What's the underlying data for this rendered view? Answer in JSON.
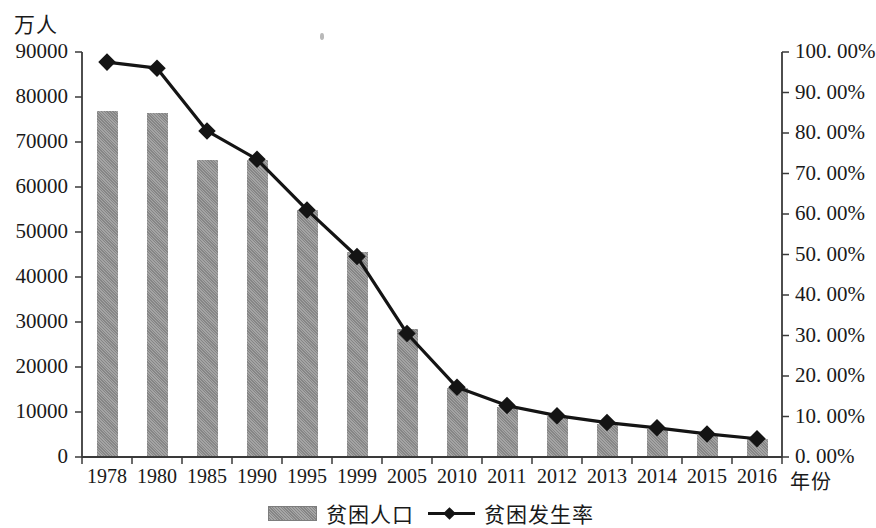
{
  "chart_data": {
    "type": "bar",
    "title": "",
    "subtitle": "",
    "xlabel": "年份",
    "ylabel": "万人",
    "ylabel_right": "",
    "categories": [
      "1978",
      "1980",
      "1985",
      "1990",
      "1995",
      "1999",
      "2005",
      "2010",
      "2011",
      "2012",
      "2013",
      "2014",
      "2015",
      "2016"
    ],
    "ylim": [
      0,
      90000
    ],
    "ylim_right": [
      0,
      100
    ],
    "ytick_labels": [
      "90000",
      "80000",
      "70000",
      "60000",
      "50000",
      "40000",
      "30000",
      "20000",
      "10000",
      "0"
    ],
    "ytick_values": [
      90000,
      80000,
      70000,
      60000,
      50000,
      40000,
      30000,
      20000,
      10000,
      0
    ],
    "ytick_labels_right": [
      "100. 00%",
      "90. 00%",
      "80. 00%",
      "70. 00%",
      "60. 00%",
      "50. 00%",
      "40. 00%",
      "30. 00%",
      "20. 00%",
      "10. 00%",
      "0. 00%"
    ],
    "ytick_values_right": [
      100,
      90,
      80,
      70,
      60,
      50,
      40,
      30,
      20,
      10,
      0
    ],
    "grid": false,
    "legend_position": "bottom",
    "series": [
      {
        "name": "贫困人口",
        "type": "bar",
        "axis": "left",
        "unit": "万人",
        "color": "#8d8d8d",
        "values": [
          77000,
          76500,
          66000,
          66000,
          55000,
          45500,
          28400,
          15300,
          11200,
          9200,
          7400,
          6300,
          4900,
          4100
        ]
      },
      {
        "name": "贫困发生率",
        "type": "line",
        "axis": "right",
        "unit": "%",
        "color": "#141414",
        "marker": "diamond",
        "values": [
          97.5,
          96.0,
          80.5,
          73.5,
          61.0,
          49.5,
          30.5,
          17.2,
          12.7,
          10.2,
          8.5,
          7.2,
          5.7,
          4.5
        ]
      }
    ]
  },
  "legend": {
    "items": [
      {
        "label": "贫困人口",
        "swatch": "bar-swatch"
      },
      {
        "label": "贫困发生率",
        "swatch": "line-diamond-swatch"
      }
    ]
  }
}
